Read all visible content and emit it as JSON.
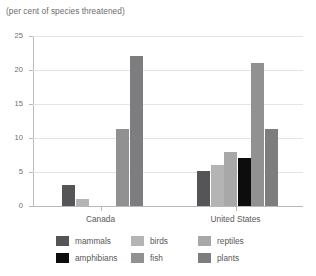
{
  "chart_data": {
    "type": "bar",
    "title": "(per cent of species threatened)",
    "xlabel": "",
    "ylabel": "",
    "ylim": [
      0,
      25
    ],
    "yticks": [
      0,
      5,
      10,
      15,
      20,
      25
    ],
    "ytick_labels": [
      "0",
      "5",
      "10",
      "15",
      "20",
      "25"
    ],
    "grid": true,
    "legend_position": "bottom",
    "categories": [
      "Canada",
      "United States"
    ],
    "series": [
      {
        "name": "mammals",
        "color": "#555558",
        "values": [
          3.1,
          5.1
        ]
      },
      {
        "name": "birds",
        "color": "#b4b4b4",
        "values": [
          1.0,
          6.0
        ]
      },
      {
        "name": "reptiles",
        "color": "#a8a8a8",
        "values": [
          0.0,
          8.0
        ]
      },
      {
        "name": "amphibians",
        "color": "#0d0d0d",
        "values": [
          0.0,
          7.0
        ]
      },
      {
        "name": "fish",
        "color": "#919191",
        "values": [
          11.3,
          21.1
        ]
      },
      {
        "name": "plants",
        "color": "#7d7d7f",
        "values": [
          22.1,
          11.3
        ]
      }
    ]
  },
  "axis": {
    "tick_labels": [
      "25",
      "20",
      "15",
      "10",
      "5",
      "0"
    ]
  },
  "categories": {
    "canada": "Canada",
    "united_states": "United States"
  },
  "legend": {
    "rows": [
      [
        {
          "label": "mammals",
          "color": "#555558"
        },
        {
          "label": "birds",
          "color": "#b4b4b4"
        },
        {
          "label": "reptiles",
          "color": "#a8a8a8"
        }
      ],
      [
        {
          "label": "amphibians",
          "color": "#0d0d0d"
        },
        {
          "label": "fish",
          "color": "#919191"
        },
        {
          "label": "plants",
          "color": "#7d7d7f"
        }
      ]
    ]
  }
}
